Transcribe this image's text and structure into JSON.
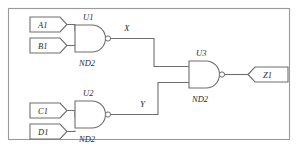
{
  "diagram": {
    "kind": "logic-schematic",
    "colors": {
      "line": "#6e6e6e",
      "frame": "#9a9a9a",
      "text": "#2b2b2b",
      "background": "#ffffff"
    }
  },
  "input_pins": [
    {
      "id": "A1",
      "label": "A1"
    },
    {
      "id": "B1",
      "label": "B1"
    },
    {
      "id": "C1",
      "label": "C1"
    },
    {
      "id": "D1",
      "label": "D1"
    }
  ],
  "output_pins": [
    {
      "id": "Z1",
      "label": "Z1"
    }
  ],
  "gates": [
    {
      "id": "U1",
      "ref": "U1",
      "type": "ND2",
      "inputs": [
        "A1",
        "B1"
      ],
      "output": "X"
    },
    {
      "id": "U2",
      "ref": "U2",
      "type": "ND2",
      "inputs": [
        "C1",
        "D1"
      ],
      "output": "Y"
    },
    {
      "id": "U3",
      "ref": "U3",
      "type": "ND2",
      "inputs": [
        "X",
        "Y"
      ],
      "output": "Z1"
    }
  ],
  "nets": [
    {
      "id": "X",
      "label": "X",
      "from": "U1",
      "to": "U3"
    },
    {
      "id": "Y",
      "label": "Y",
      "from": "U2",
      "to": "U3"
    }
  ]
}
